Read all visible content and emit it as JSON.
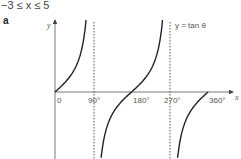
{
  "header": {
    "range_text": "−3 ≤ x ≤ 5",
    "part_label": "a"
  },
  "chart_data": {
    "type": "line",
    "title": "",
    "function_label": "y = tan θ",
    "xlabel": "x",
    "ylabel": "y",
    "x_ticks": [
      "0",
      "90°",
      "180°",
      "270°",
      "360°"
    ],
    "x_range": [
      0,
      360
    ],
    "asymptotes": [
      90,
      270
    ],
    "asymptote_style": "dotted",
    "grid": false,
    "series": [
      {
        "name": "y = tan θ",
        "x": [
          0,
          30,
          45,
          60,
          75,
          85,
          95,
          105,
          120,
          135,
          150,
          180,
          210,
          225,
          240,
          255,
          265,
          275,
          285,
          300,
          315,
          330,
          360
        ],
        "y": [
          0,
          0.58,
          1,
          1.73,
          3.73,
          11.4,
          -11.4,
          -3.73,
          -1.73,
          -1,
          -0.58,
          0,
          0.58,
          1,
          1.73,
          3.73,
          11.4,
          -11.4,
          -3.73,
          -1.73,
          -1,
          -0.58,
          0
        ]
      }
    ]
  }
}
